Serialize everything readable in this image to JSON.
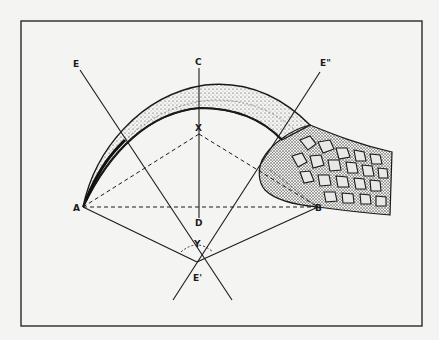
{
  "figure": {
    "type": "geometric diagram of a curved claw with scaled toe",
    "labels": {
      "E": "E",
      "C": "C",
      "E2": "E\"",
      "X": "X",
      "A": "A",
      "B": "B",
      "D": "D",
      "Y": "Y",
      "E1": "E'"
    },
    "colors": {
      "ink": "#1a1a1a",
      "paper": "#f4f4f2",
      "frame": "#2a2a2a"
    }
  }
}
